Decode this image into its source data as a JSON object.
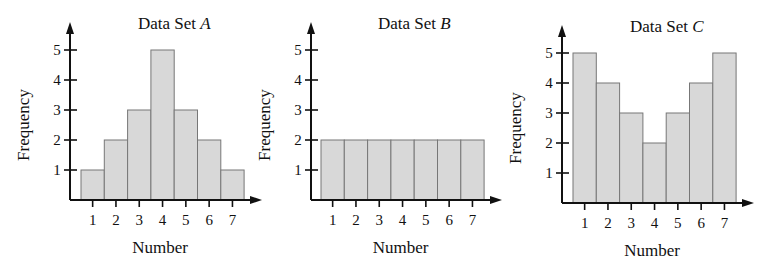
{
  "chart_data": [
    {
      "type": "bar",
      "title": "Data Set A",
      "title_prefix": "Data Set ",
      "title_letter": "A",
      "xlabel": "Number",
      "ylabel": "Frequency",
      "categories": [
        "1",
        "2",
        "3",
        "4",
        "5",
        "6",
        "7"
      ],
      "values": [
        1,
        2,
        3,
        5,
        3,
        2,
        1
      ],
      "yticks": [
        "1",
        "2",
        "3",
        "4",
        "5"
      ],
      "ylim": [
        0,
        5.5
      ],
      "grid": false
    },
    {
      "type": "bar",
      "title": "Data Set B",
      "title_prefix": "Data Set ",
      "title_letter": "B",
      "xlabel": "Number",
      "ylabel": "Frequency",
      "categories": [
        "1",
        "2",
        "3",
        "4",
        "5",
        "6",
        "7"
      ],
      "values": [
        2,
        2,
        2,
        2,
        2,
        2,
        2
      ],
      "yticks": [
        "1",
        "2",
        "3",
        "4",
        "5"
      ],
      "ylim": [
        0,
        5.5
      ],
      "grid": false
    },
    {
      "type": "bar",
      "title": "Data Set C",
      "title_prefix": "Data Set ",
      "title_letter": "C",
      "xlabel": "Number",
      "ylabel": "Frequency",
      "categories": [
        "1",
        "2",
        "3",
        "4",
        "5",
        "6",
        "7"
      ],
      "values": [
        5,
        4,
        3,
        2,
        3,
        4,
        5
      ],
      "yticks": [
        "1",
        "2",
        "3",
        "4",
        "5"
      ],
      "ylim": [
        0,
        5.5
      ],
      "grid": false
    }
  ],
  "colors": {
    "bar_fill": "#d8d8d8",
    "bar_stroke": "#777777",
    "axis": "#111111"
  }
}
